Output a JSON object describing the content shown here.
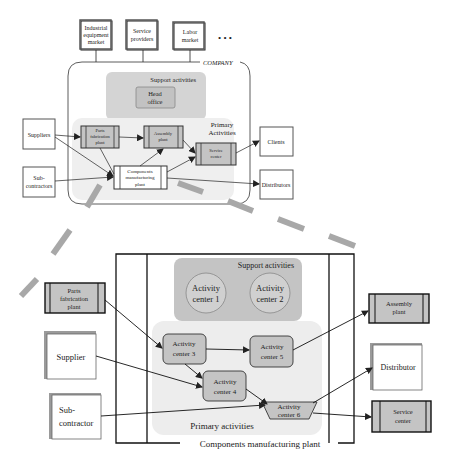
{
  "top": {
    "markets": [
      {
        "lines": [
          "Industrial",
          "equipment",
          "market"
        ]
      },
      {
        "lines": [
          "Service",
          "providers"
        ]
      },
      {
        "lines": [
          "Labor",
          "market"
        ]
      }
    ],
    "ellipsis": "• • •",
    "company_label": "COMPANY",
    "support_label": "Support activities",
    "head_office": [
      "Head",
      "office"
    ],
    "primary_label": [
      "Primary",
      "Activities"
    ],
    "suppliers": "Suppliers",
    "subcontractors": [
      "Sub-",
      "contractors"
    ],
    "parts_plant": [
      "Parts",
      "fabrication",
      "plant"
    ],
    "assembly_plant": [
      "Assembly",
      "plant"
    ],
    "service_center": [
      "Service",
      "center"
    ],
    "components_plant": [
      "Components",
      "manufacturing",
      "plant"
    ],
    "clients": "Clients",
    "distributors": "Distributors"
  },
  "bottom": {
    "support_label": "Support activities",
    "ac1": [
      "Activity",
      "center 1"
    ],
    "ac2": [
      "Activity",
      "center 2"
    ],
    "ac3": [
      "Activity",
      "center 3"
    ],
    "ac4": [
      "Activity",
      "center 4"
    ],
    "ac5": [
      "Activity",
      "center 5"
    ],
    "ac6": [
      "Activity",
      "center 6"
    ],
    "primary_label": "Primary activities",
    "plant_label": "Components manufacturing plant",
    "parts_plant": [
      "Parts",
      "fabrication",
      "plant"
    ],
    "supplier": "Supplier",
    "subcontractor": [
      "Sub-",
      "contractor"
    ],
    "assembly_plant": [
      "Assembly",
      "plant"
    ],
    "distributor": "Distributor",
    "service_center": [
      "Service",
      "center"
    ]
  },
  "colors": {
    "gray_box": "#c8c8c8",
    "light_region": "#ececec",
    "support_region": "#c4c4c4",
    "dash": "#a8a8a8",
    "line": "#222222"
  }
}
